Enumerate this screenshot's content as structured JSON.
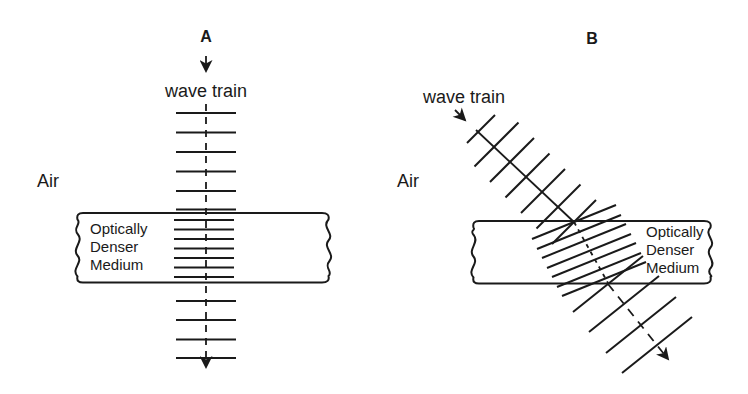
{
  "figure": {
    "colors": {
      "ink": "#1a1a1a",
      "background": "#ffffff"
    },
    "panel_a": {
      "label": "A",
      "wave_train_label": "wave train",
      "air_label": "Air",
      "medium_line1": "Optically",
      "medium_line2": "Denser",
      "medium_line3": "Medium"
    },
    "panel_b": {
      "label": "B",
      "wave_train_label": "wave train",
      "air_label": "Air",
      "medium_line1": "Optically",
      "medium_line2": "Denser",
      "medium_line3": "Medium"
    }
  }
}
